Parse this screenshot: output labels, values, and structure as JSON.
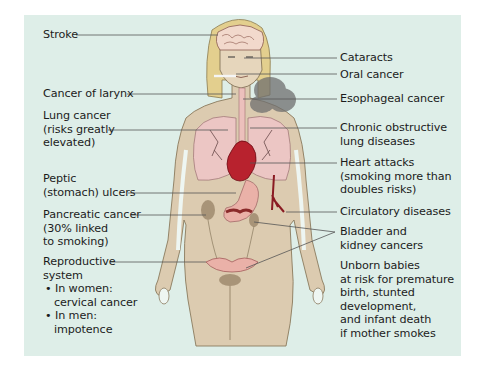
{
  "diagram": {
    "colors": {
      "background": "#deeee8",
      "skin": "#dccbb0",
      "hair": "#e3cf8e",
      "brain": "#f2d9cc",
      "lungs": "#ecc6c4",
      "heart": "#b8222e",
      "stomach": "#eab1a8",
      "smoke": "#6f6f6f",
      "leader_line": "#555555",
      "text": "#1c1c1c"
    },
    "left_labels": [
      {
        "id": "stroke",
        "lines": [
          "Stroke"
        ]
      },
      {
        "id": "larynx",
        "lines": [
          "Cancer of larynx"
        ]
      },
      {
        "id": "lung",
        "lines": [
          "Lung cancer",
          "(risks greatly",
          "elevated)"
        ]
      },
      {
        "id": "peptic",
        "lines": [
          "Peptic",
          "(stomach) ulcers"
        ]
      },
      {
        "id": "pancreatic",
        "lines": [
          "Pancreatic cancer",
          "(30% linked",
          "to smoking)"
        ]
      },
      {
        "id": "reproductive",
        "lines": [
          "Reproductive",
          "system"
        ],
        "bullets": [
          [
            "• In women:",
            "cervical cancer"
          ],
          [
            "• In men:",
            "impotence"
          ]
        ]
      }
    ],
    "right_labels": [
      {
        "id": "cataracts",
        "lines": [
          "Cataracts"
        ]
      },
      {
        "id": "oral",
        "lines": [
          "Oral cancer"
        ]
      },
      {
        "id": "esophageal",
        "lines": [
          "Esophageal cancer"
        ]
      },
      {
        "id": "copd",
        "lines": [
          "Chronic obstructive",
          "lung diseases"
        ]
      },
      {
        "id": "heart",
        "lines": [
          "Heart attacks",
          "(smoking more than",
          "doubles risks)"
        ]
      },
      {
        "id": "circulatory",
        "lines": [
          "Circulatory diseases"
        ]
      },
      {
        "id": "bladder",
        "lines": [
          "Bladder and",
          "kidney cancers"
        ]
      },
      {
        "id": "unborn",
        "lines": [
          "Unborn babies",
          "at risk for premature",
          "birth, stunted",
          "development,",
          "and infant death",
          "if mother smokes"
        ]
      }
    ]
  }
}
